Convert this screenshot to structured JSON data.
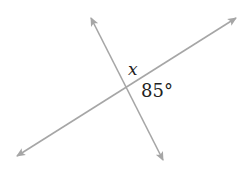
{
  "diagram": {
    "type": "intersecting-lines",
    "line_color": "#a6a6a6",
    "labels": {
      "unknown_angle": "x",
      "known_angle": "85°"
    },
    "lines": [
      {
        "name": "line-1",
        "from": [
          91,
          18
        ],
        "to": [
          163,
          160
        ]
      },
      {
        "name": "line-2",
        "from": [
          17,
          156
        ],
        "to": [
          236,
          18
        ]
      }
    ]
  }
}
